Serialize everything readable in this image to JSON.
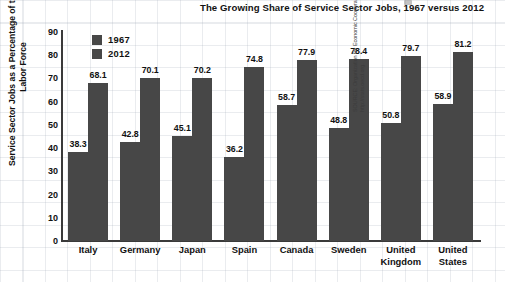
{
  "chart_data": {
    "type": "bar",
    "title": "The Growing Share of Service Sector Jobs, 1967 versus 2012",
    "xlabel": "",
    "ylabel": "Service Sector Jobs as a Percentage of the Total Labor Force",
    "ylim": [
      0,
      90
    ],
    "yticks": [
      90,
      80,
      70,
      60,
      50,
      40,
      30,
      20,
      10,
      0
    ],
    "grid": true,
    "legend_position": "top-left",
    "categories": [
      "Italy",
      "Germany",
      "Japan",
      "Spain",
      "Canada",
      "Sweden",
      "United Kingdom",
      "United States"
    ],
    "category_lines": [
      [
        "Italy"
      ],
      [
        "Germany"
      ],
      [
        "Japan"
      ],
      [
        "Spain"
      ],
      [
        "Canada"
      ],
      [
        "Sweden"
      ],
      [
        "United",
        "Kingdom"
      ],
      [
        "United",
        "States"
      ]
    ],
    "series": [
      {
        "name": "1967",
        "color": "#474747",
        "values": [
          38.3,
          42.8,
          45.1,
          36.2,
          58.7,
          48.8,
          50.8,
          58.9
        ]
      },
      {
        "name": "2012",
        "color": "#474747",
        "values": [
          68.1,
          70.1,
          70.2,
          74.8,
          77.9,
          78.4,
          79.7,
          81.2
        ]
      }
    ],
    "source": "SOURCE: Organization for Economic Cooperation and Development, Labor Force Statistics, various years, http://stats.oecd.org."
  }
}
